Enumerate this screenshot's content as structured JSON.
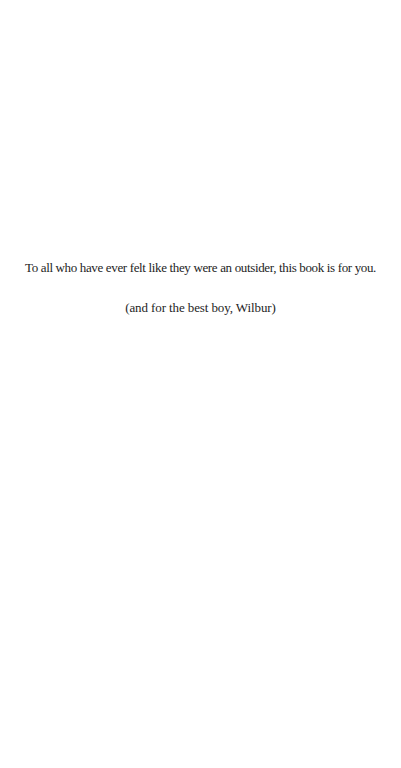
{
  "page": {
    "type": "dedication",
    "background": "#ffffff",
    "text_color": "#1e1e1e"
  },
  "dedication": {
    "line_1": "To all who have ever felt like they were an outsider, this book is for you.",
    "line_2": "(and for the best boy, Wilbur)"
  }
}
